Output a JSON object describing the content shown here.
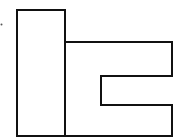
{
  "diagram": {
    "width": 187,
    "height": 137,
    "stroke_color": "#111111",
    "background": "#ffffff",
    "stroke_width": 2,
    "shapes": [
      {
        "name": "left-column-rectangle",
        "type": "rect",
        "x": 17,
        "y": 10,
        "w": 48,
        "h": 128
      },
      {
        "name": "right-bracket-shape",
        "type": "polyline",
        "points": "65,42 172,42 172,76 101,76 101,105 172,105 172,138"
      },
      {
        "name": "bottom-edge-line",
        "type": "line",
        "x1": 17,
        "y1": 136,
        "x2": 172,
        "y2": 136
      }
    ],
    "marks": [
      {
        "name": "dot-mark",
        "cx": 1.5,
        "cy": 24.5,
        "r": 1
      }
    ]
  }
}
